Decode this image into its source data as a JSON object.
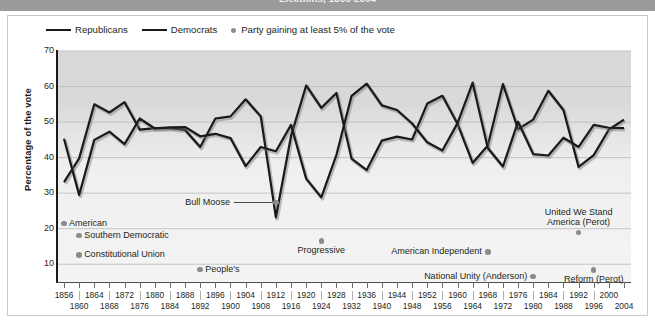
{
  "banner": {
    "title": "Elections, 1856-2004"
  },
  "legend": {
    "republicans": "Republicans",
    "democrats": "Democrats",
    "third_party": "Party gaining at least 5% of the vote"
  },
  "axis": {
    "ylabel": "Percentage of the vote",
    "yticks": [
      "70",
      "60",
      "50",
      "40",
      "30",
      "20",
      "10"
    ]
  },
  "annotations": [
    {
      "label": "American",
      "x": 1856,
      "y": 21.5,
      "side": "right"
    },
    {
      "label": "Southern Democratic",
      "x": 1860,
      "y": 18.1,
      "side": "right"
    },
    {
      "label": "Constitutional Union",
      "x": 1860,
      "y": 12.6,
      "side": "right"
    },
    {
      "label": "People's",
      "x": 1892,
      "y": 8.5,
      "side": "right"
    },
    {
      "label": "Bull Moose",
      "x": 1912,
      "y": 27.4,
      "side": "left"
    },
    {
      "label": "Progressive",
      "x": 1924,
      "y": 16.6,
      "side": "below"
    },
    {
      "label": "American Independent",
      "x": 1968,
      "y": 13.5,
      "side": "left"
    },
    {
      "label": "National Unity (Anderson)",
      "x": 1980,
      "y": 6.6,
      "side": "left"
    },
    {
      "label": "United We Stand America (Perot)",
      "x": 1992,
      "y": 18.9,
      "side": "above"
    },
    {
      "label": "Reform (Perot)",
      "x": 1996,
      "y": 8.4,
      "side": "below"
    }
  ],
  "chart_data": {
    "type": "line",
    "title": "Elections, 1856-2004",
    "xlabel": "",
    "ylabel": "Percentage of the vote",
    "ylim": [
      5,
      70
    ],
    "xlim": [
      1856,
      2004
    ],
    "grid": true,
    "legend_position": "top",
    "x": [
      1856,
      1860,
      1864,
      1868,
      1872,
      1876,
      1880,
      1884,
      1888,
      1892,
      1896,
      1900,
      1904,
      1908,
      1912,
      1916,
      1920,
      1924,
      1928,
      1932,
      1936,
      1940,
      1944,
      1948,
      1952,
      1956,
      1960,
      1964,
      1968,
      1972,
      1976,
      1980,
      1984,
      1988,
      1992,
      1996,
      2000,
      2004
    ],
    "series": [
      {
        "name": "Republicans",
        "color": "#1a1a1a",
        "values": [
          33.1,
          39.8,
          55.0,
          52.7,
          55.6,
          47.9,
          48.3,
          48.3,
          47.8,
          43.0,
          51.0,
          51.6,
          56.4,
          51.6,
          23.2,
          46.1,
          60.3,
          54.0,
          58.2,
          39.7,
          36.5,
          44.8,
          45.9,
          45.1,
          55.2,
          57.4,
          49.5,
          38.5,
          43.4,
          60.7,
          48.0,
          50.7,
          58.8,
          53.4,
          37.4,
          40.7,
          47.9,
          50.7
        ]
      },
      {
        "name": "Democrats",
        "color": "#1a1a1a",
        "values": [
          45.3,
          29.5,
          45.0,
          47.3,
          43.8,
          51.0,
          48.2,
          48.5,
          48.6,
          46.0,
          46.7,
          45.5,
          37.6,
          43.0,
          41.8,
          49.2,
          34.1,
          28.8,
          40.8,
          57.4,
          60.8,
          54.7,
          53.4,
          49.6,
          44.3,
          42.0,
          49.7,
          61.1,
          42.7,
          37.5,
          50.1,
          41.0,
          40.6,
          45.6,
          43.0,
          49.2,
          48.4,
          48.3
        ]
      }
    ],
    "third_parties": [
      {
        "name": "American",
        "year": 1856,
        "value": 21.5
      },
      {
        "name": "Southern Democratic",
        "year": 1860,
        "value": 18.1
      },
      {
        "name": "Constitutional Union",
        "year": 1860,
        "value": 12.6
      },
      {
        "name": "People's",
        "year": 1892,
        "value": 8.5
      },
      {
        "name": "Bull Moose",
        "year": 1912,
        "value": 27.4
      },
      {
        "name": "Progressive",
        "year": 1924,
        "value": 16.6
      },
      {
        "name": "American Independent",
        "year": 1968,
        "value": 13.5
      },
      {
        "name": "National Unity (Anderson)",
        "year": 1980,
        "value": 6.6
      },
      {
        "name": "United We Stand America (Perot)",
        "year": 1992,
        "value": 18.9
      },
      {
        "name": "Reform (Perot)",
        "year": 1996,
        "value": 8.4
      }
    ]
  }
}
